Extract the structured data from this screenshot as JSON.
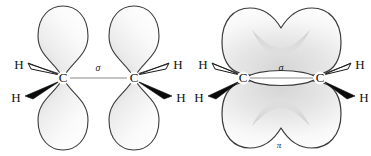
{
  "figure": {
    "background_color": "#ffffff",
    "outline_color": "#3a3a3a",
    "lobe_fill_light": "#fbfbfb",
    "lobe_fill_mid": "#e9e9e9",
    "lobe_fill_shadow": "#c9c9c9",
    "wedge_solid_color": "#0a0a0a",
    "wedge_hollow_fill": "#ffffff",
    "bond_line_color": "#7a7a7a",
    "label_color": "#111111"
  },
  "panels": [
    {
      "id": "left-panel",
      "name": "unhybridized-p-orbitals",
      "caption": "",
      "atoms": [
        {
          "id": "c-left",
          "label": "C",
          "x": 63,
          "y": 78
        },
        {
          "id": "c-right",
          "label": "C",
          "x": 134,
          "y": 78
        }
      ],
      "hydrogens": [
        {
          "id": "h-top-left",
          "label": "H",
          "x": 19,
          "y": 66,
          "wedge": "hollow"
        },
        {
          "id": "h-bottom-left",
          "label": "H",
          "x": 16,
          "y": 99,
          "wedge": "solid"
        },
        {
          "id": "h-top-right",
          "label": "H",
          "x": 178,
          "y": 66,
          "wedge": "hollow"
        },
        {
          "id": "h-bottom-right",
          "label": "H",
          "x": 181,
          "y": 99,
          "wedge": "solid"
        }
      ],
      "bond_label": {
        "text": "σ",
        "x": 98,
        "y": 69
      },
      "orbitals": [
        {
          "id": "p-left-up",
          "orientation": "up",
          "cx": 63,
          "cy": 78
        },
        {
          "id": "p-left-down",
          "orientation": "down",
          "cx": 63,
          "cy": 78
        },
        {
          "id": "p-right-up",
          "orientation": "up",
          "cx": 134,
          "cy": 78
        },
        {
          "id": "p-right-down",
          "orientation": "down",
          "cx": 134,
          "cy": 78
        }
      ]
    },
    {
      "id": "right-panel",
      "name": "pi-bond-overlap",
      "caption": "",
      "atoms": [
        {
          "id": "c-left",
          "label": "C",
          "x": 243,
          "y": 78
        },
        {
          "id": "c-right",
          "label": "C",
          "x": 320,
          "y": 78
        }
      ],
      "hydrogens": [
        {
          "id": "h-top-left",
          "label": "H",
          "x": 203,
          "y": 66,
          "wedge": "hollow"
        },
        {
          "id": "h-bottom-left",
          "label": "H",
          "x": 199,
          "y": 99,
          "wedge": "solid"
        },
        {
          "id": "h-top-right",
          "label": "H",
          "x": 360,
          "y": 66,
          "wedge": "hollow"
        },
        {
          "id": "h-bottom-right",
          "label": "H",
          "x": 364,
          "y": 99,
          "wedge": "solid"
        }
      ],
      "bond_label": {
        "text": "σ",
        "x": 281,
        "y": 69
      },
      "pi_label": {
        "text": "π",
        "x": 279,
        "y": 146
      },
      "clouds": [
        {
          "id": "pi-cloud-top",
          "orientation": "up"
        },
        {
          "id": "pi-cloud-bottom",
          "orientation": "down"
        }
      ]
    }
  ]
}
